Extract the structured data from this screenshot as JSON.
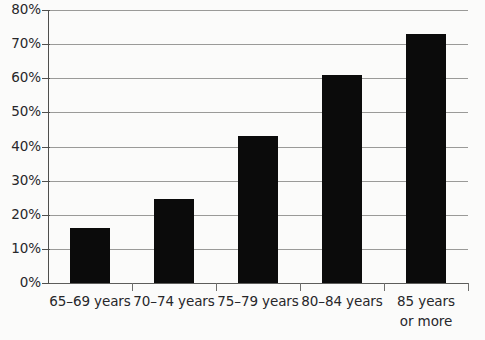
{
  "chart_data": {
    "type": "bar",
    "title": "",
    "subtitle": "",
    "xlabel": "",
    "ylabel": "",
    "categories": [
      "65–69 years",
      "70–74 years",
      "75–79 years",
      "80–84 years",
      "85 years\nor more"
    ],
    "values": [
      16,
      24.5,
      43,
      61,
      73
    ],
    "ylim": [
      0,
      80
    ],
    "ytick_labels": [
      "0%",
      "10%",
      "20%",
      "30%",
      "40%",
      "50%",
      "60%",
      "70%",
      "80%"
    ],
    "ytick_values": [
      0,
      10,
      20,
      30,
      40,
      50,
      60,
      70,
      80
    ],
    "grid": true,
    "legend": "none",
    "series": [
      {
        "name": "",
        "values": [
          16,
          24.5,
          43,
          61,
          73
        ]
      }
    ],
    "colors": {
      "bar": "#0b0b0b",
      "gridline": "#9a9a98",
      "axis": "#4f4f4d",
      "text": "#27272a",
      "background": "#fbfbfa"
    }
  }
}
